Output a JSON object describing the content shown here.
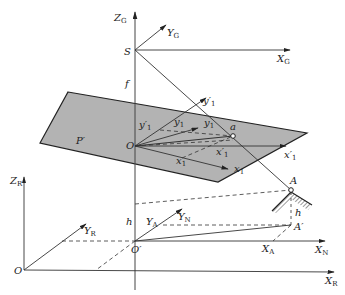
{
  "diagram": {
    "type": "coordinate-systems-geometry",
    "labels": {
      "ZG": "Z",
      "ZG_sub": "G",
      "YG": "Y",
      "YG_sub": "G",
      "XG": "X",
      "XG_sub": "G",
      "S": "S",
      "f": "f",
      "P": "P′",
      "O": "O",
      "y1p_top": "y′",
      "y1p_top_sub": "1",
      "y1p": "y′",
      "y1p_sub": "1",
      "y1a": "y",
      "y1a_sub": "1",
      "y1b": "y",
      "y1b_sub": "1",
      "a": "a",
      "x1a": "x",
      "x1a_sub": "1",
      "x1p": "x′",
      "x1p_sub": "1",
      "x1p_axis": "x′",
      "x1p_axis_sub": "1",
      "x1_axis": "x",
      "x1_axis_sub": "1",
      "A": "A",
      "ZR": "Z",
      "ZR_sub": "R",
      "YR": "Y",
      "YR_sub": "R",
      "h1": "h",
      "h2": "h",
      "YA": "Y",
      "YA_sub": "A",
      "YN": "Y",
      "YN_sub": "N",
      "Ap": "A′",
      "XA": "X",
      "XA_sub": "A",
      "XN": "X",
      "XN_sub": "N",
      "O_R": "O",
      "Op": "O′",
      "XR": "X",
      "XR_sub": "R"
    },
    "colors": {
      "line": "#333333",
      "plane_fill": "#b3b3b3",
      "plane_stroke": "#222222"
    }
  }
}
